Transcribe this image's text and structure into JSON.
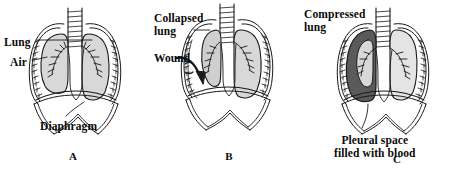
{
  "figure": {
    "background_color": "#ffffff",
    "line_color": "#1a1a1a",
    "lung_fill": "#d8d8d8",
    "lung_fill_light": "#e4e4e4",
    "blood_fill": "#5a5a5a",
    "collapsed_lung_fill": "#cfcfcf"
  },
  "panels": [
    {
      "id": "A",
      "letter": "A",
      "labels": [
        {
          "key": "lung",
          "text": "Lung"
        },
        {
          "key": "air",
          "text": "Air"
        },
        {
          "key": "diaphragm",
          "text": "Diaphragm"
        }
      ]
    },
    {
      "id": "B",
      "letter": "B",
      "labels": [
        {
          "key": "collapsed_lung",
          "text": "Collapsed\nlung"
        },
        {
          "key": "wound",
          "text": "Wound"
        },
        {
          "key": "compressed_lung",
          "text": "Compressed\nlung"
        }
      ]
    },
    {
      "id": "C",
      "letter": "C",
      "labels": [
        {
          "key": "pleural_space",
          "text": "Pleural space\nfilled with blood"
        }
      ]
    }
  ],
  "panel_a": {
    "lung_label": "Lung",
    "air_label": "Air",
    "diaphragm_label": "Diaphragm",
    "letter": "A"
  },
  "panel_b": {
    "collapsed_lung_label": "Collapsed\nlung",
    "wound_label": "Wound",
    "letter": "B"
  },
  "panel_c": {
    "compressed_lung_label": "Compressed\nlung",
    "pleural_space_label": "Pleural space\nfilled with blood",
    "letter": "C"
  }
}
